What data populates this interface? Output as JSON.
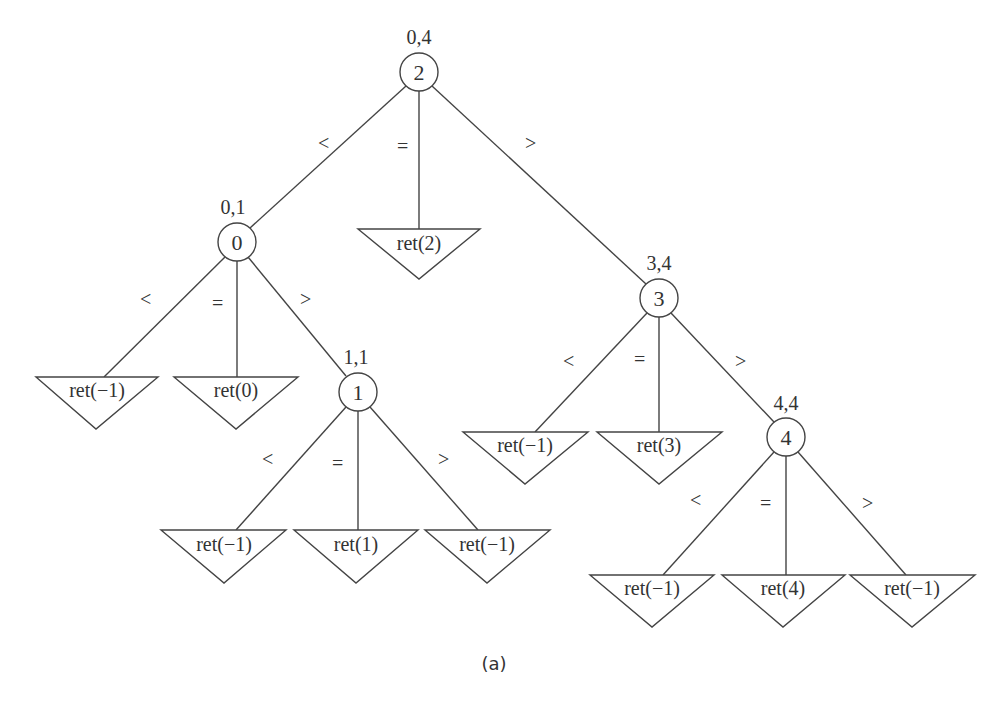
{
  "figure": {
    "caption": "(a)",
    "nodes": [
      {
        "id": "n2",
        "value": "2",
        "range": "0,4"
      },
      {
        "id": "n0",
        "value": "0",
        "range": "0,1"
      },
      {
        "id": "n1",
        "value": "1",
        "range": "1,1"
      },
      {
        "id": "n3",
        "value": "3",
        "range": "3,4"
      },
      {
        "id": "n4",
        "value": "4",
        "range": "4,4"
      }
    ],
    "leaves": [
      {
        "id": "l2",
        "label": "ret(2)"
      },
      {
        "id": "l0a",
        "label": "ret(−1)"
      },
      {
        "id": "l0b",
        "label": "ret(0)"
      },
      {
        "id": "l1a",
        "label": "ret(−1)"
      },
      {
        "id": "l1b",
        "label": "ret(1)"
      },
      {
        "id": "l1c",
        "label": "ret(−1)"
      },
      {
        "id": "l3a",
        "label": "ret(−1)"
      },
      {
        "id": "l3b",
        "label": "ret(3)"
      },
      {
        "id": "l4a",
        "label": "ret(−1)"
      },
      {
        "id": "l4b",
        "label": "ret(4)"
      },
      {
        "id": "l4c",
        "label": "ret(−1)"
      }
    ],
    "ops": {
      "lt": "<",
      "eq": "=",
      "gt": ">"
    }
  }
}
